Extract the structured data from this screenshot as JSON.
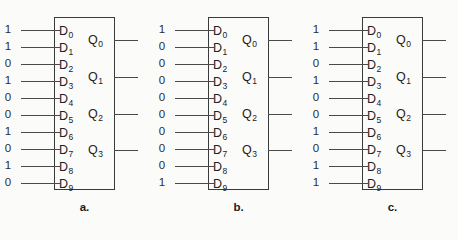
{
  "figure": {
    "caption_labels": [
      "a.",
      "b.",
      "c."
    ],
    "input_pin_labels": [
      "D0",
      "D1",
      "D2",
      "D3",
      "D4",
      "D5",
      "D6",
      "D7",
      "D8",
      "D9"
    ],
    "input_pin_label_base": "D",
    "input_pin_subscripts": [
      "0",
      "1",
      "2",
      "3",
      "4",
      "5",
      "6",
      "7",
      "8",
      "9"
    ],
    "output_pin_label_base": "Q",
    "output_pin_subscripts": [
      "0",
      "1",
      "2",
      "3"
    ],
    "output_pin_labels": [
      "Q0",
      "Q1",
      "Q2",
      "Q3"
    ],
    "colors": {
      "background": "#fbfbfa",
      "line": "#4a4a4a",
      "box_border": "#3a3a3a",
      "text": "#222222"
    }
  },
  "chart_data": {
    "type": "diagram",
    "title": "",
    "diagram_kind": "decimal-to-BCD encoder logic symbols",
    "panels": [
      {
        "caption": "a.",
        "inputs": [
          {
            "pin": "D0",
            "value": "1"
          },
          {
            "pin": "D1",
            "value": "1"
          },
          {
            "pin": "D2",
            "value": "0"
          },
          {
            "pin": "D3",
            "value": "1"
          },
          {
            "pin": "D4",
            "value": "0"
          },
          {
            "pin": "D5",
            "value": "0"
          },
          {
            "pin": "D6",
            "value": "1"
          },
          {
            "pin": "D7",
            "value": "0"
          },
          {
            "pin": "D8",
            "value": "1"
          },
          {
            "pin": "D9",
            "value": "0"
          }
        ],
        "input_values": [
          "1",
          "1",
          "0",
          "1",
          "0",
          "0",
          "1",
          "0",
          "1",
          "0"
        ],
        "outputs": [
          "Q0",
          "Q1",
          "Q2",
          "Q3"
        ],
        "output_values": [
          "",
          "",
          "",
          ""
        ]
      },
      {
        "caption": "b.",
        "inputs": [
          {
            "pin": "D0",
            "value": "1"
          },
          {
            "pin": "D1",
            "value": "0"
          },
          {
            "pin": "D2",
            "value": "0"
          },
          {
            "pin": "D3",
            "value": "0"
          },
          {
            "pin": "D4",
            "value": "0"
          },
          {
            "pin": "D5",
            "value": "0"
          },
          {
            "pin": "D6",
            "value": "0"
          },
          {
            "pin": "D7",
            "value": "0"
          },
          {
            "pin": "D8",
            "value": "0"
          },
          {
            "pin": "D9",
            "value": "1"
          }
        ],
        "input_values": [
          "1",
          "0",
          "0",
          "0",
          "0",
          "0",
          "0",
          "0",
          "0",
          "1"
        ],
        "outputs": [
          "Q0",
          "Q1",
          "Q2",
          "Q3"
        ],
        "output_values": [
          "",
          "",
          "",
          ""
        ]
      },
      {
        "caption": "c.",
        "inputs": [
          {
            "pin": "D0",
            "value": "1"
          },
          {
            "pin": "D1",
            "value": "1"
          },
          {
            "pin": "D2",
            "value": "0"
          },
          {
            "pin": "D3",
            "value": "1"
          },
          {
            "pin": "D4",
            "value": "0"
          },
          {
            "pin": "D5",
            "value": "0"
          },
          {
            "pin": "D6",
            "value": "1"
          },
          {
            "pin": "D7",
            "value": "0"
          },
          {
            "pin": "D8",
            "value": "1"
          },
          {
            "pin": "D9",
            "value": "1"
          }
        ],
        "input_values": [
          "1",
          "1",
          "0",
          "1",
          "0",
          "0",
          "1",
          "0",
          "1",
          "1"
        ],
        "outputs": [
          "Q0",
          "Q1",
          "Q2",
          "Q3"
        ],
        "output_values": [
          "",
          "",
          "",
          ""
        ]
      }
    ]
  }
}
